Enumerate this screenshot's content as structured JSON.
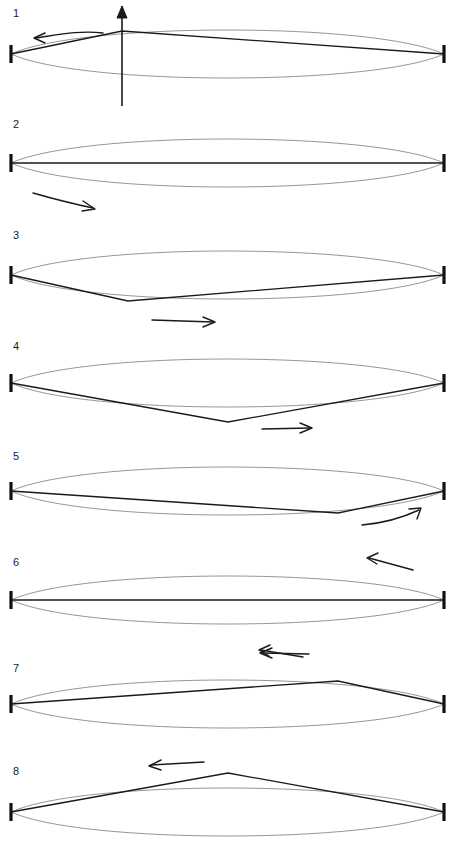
{
  "figure": {
    "width": 460,
    "height": 846,
    "background_color": "#ffffff",
    "string_color": "#1a1a1a",
    "envelope_color": "#8a8a8a",
    "support_color": "#111111"
  },
  "geometry": {
    "left_support_x": 11,
    "right_support_x": 444,
    "support_half_height": 9,
    "envelope_amplitude": 26
  },
  "chart_data": {
    "type": "line",
    "xlabel": "",
    "ylabel": "",
    "xlim": [
      11,
      444
    ],
    "grid": false,
    "legend": "none",
    "series": [
      {
        "name": "panel-1",
        "label": "1",
        "vertex_fraction": 0.256,
        "vertex_offset": -22,
        "shape": "peak",
        "x": [
          11,
          122,
          444
        ],
        "y": [
          0,
          -22,
          0
        ]
      },
      {
        "name": "panel-2",
        "label": "2",
        "vertex_fraction": 0.0,
        "vertex_offset": 0,
        "shape": "flat",
        "x": [
          11,
          444
        ],
        "y": [
          0,
          0
        ]
      },
      {
        "name": "panel-3",
        "label": "3",
        "vertex_fraction": 0.27,
        "vertex_offset": 22,
        "shape": "dip",
        "x": [
          11,
          128,
          444
        ],
        "y": [
          0,
          22,
          0
        ]
      },
      {
        "name": "panel-4",
        "label": "4",
        "vertex_fraction": 0.5,
        "vertex_offset": 26,
        "shape": "dip",
        "x": [
          11,
          228,
          444
        ],
        "y": [
          0,
          26,
          0
        ]
      },
      {
        "name": "panel-5",
        "label": "5",
        "vertex_fraction": 0.755,
        "vertex_offset": 22,
        "shape": "dip",
        "x": [
          11,
          338,
          444
        ],
        "y": [
          0,
          22,
          0
        ]
      },
      {
        "name": "panel-6",
        "label": "6",
        "vertex_fraction": 0.0,
        "vertex_offset": 0,
        "shape": "flat",
        "x": [
          11,
          444
        ],
        "y": [
          0,
          0
        ]
      },
      {
        "name": "panel-7",
        "label": "7",
        "vertex_fraction": 0.755,
        "vertex_offset": -22,
        "shape": "peak",
        "x": [
          11,
          338,
          444
        ],
        "y": [
          0,
          -22,
          0
        ]
      },
      {
        "name": "panel-8",
        "label": "8",
        "vertex_fraction": 0.5,
        "vertex_offset": -26,
        "shape": "peak",
        "x": [
          11,
          228,
          444
        ],
        "y": [
          0,
          -26,
          0
        ]
      }
    ]
  },
  "panels": [
    {
      "number": "1",
      "label_x": 13,
      "label_y": 17,
      "baseline_y": 54,
      "vertex_x": 122,
      "vertex_y": 31,
      "shape": "peak",
      "has_axis_arrow": true,
      "axis_arrow": {
        "x": 122,
        "y_bottom": 106,
        "y_top": 6
      },
      "motion_arrows": [
        {
          "name": "pulse-direction-arrow-left",
          "direction": "left",
          "path": "M 103,33 C 80,30 57,35 36,38",
          "head": "M 45,33 L 34,38 L 45,43"
        }
      ]
    },
    {
      "number": "2",
      "label_x": 13,
      "label_y": 128,
      "baseline_y": 163,
      "vertex_x": 0,
      "vertex_y": 163,
      "shape": "flat",
      "has_axis_arrow": false,
      "motion_arrows": [
        {
          "name": "pulse-direction-arrow-right",
          "direction": "right",
          "path": "M 33,193 C 54,199 74,204 93,208",
          "head": "M 83,201 L 95,209 L 82,211"
        }
      ]
    },
    {
      "number": "3",
      "label_x": 13,
      "label_y": 239,
      "baseline_y": 275,
      "vertex_x": 128,
      "vertex_y": 301,
      "shape": "dip",
      "has_axis_arrow": false,
      "motion_arrows": [
        {
          "name": "pulse-direction-arrow-right",
          "direction": "right",
          "path": "M 152,320 L 213,322",
          "head": "M 203,317 L 215,322 L 203,327"
        }
      ]
    },
    {
      "number": "4",
      "label_x": 13,
      "label_y": 350,
      "baseline_y": 383,
      "vertex_x": 228,
      "vertex_y": 422,
      "shape": "dip",
      "has_axis_arrow": false,
      "motion_arrows": [
        {
          "name": "pulse-direction-arrow-right",
          "direction": "right",
          "path": "M 262,429 L 310,428",
          "head": "M 300,423 L 312,428 L 300,433"
        }
      ]
    },
    {
      "number": "5",
      "label_x": 13,
      "label_y": 460,
      "baseline_y": 491,
      "vertex_x": 338,
      "vertex_y": 513,
      "shape": "dip",
      "has_axis_arrow": false,
      "motion_arrows": [
        {
          "name": "pulse-direction-arrow-right",
          "direction": "right",
          "path": "M 362,525 C 385,523 404,517 419,510",
          "head": "M 409,509 L 421,508 L 417,519"
        }
      ]
    },
    {
      "number": "6",
      "label_x": 13,
      "label_y": 566,
      "baseline_y": 600,
      "vertex_x": 0,
      "vertex_y": 600,
      "shape": "flat",
      "has_axis_arrow": false,
      "motion_arrows": [
        {
          "name": "pulse-direction-arrow-left-upper",
          "direction": "left",
          "path": "M 413,570 L 369,558",
          "head": "M 378,553 L 367,558 L 377,564"
        },
        {
          "name": "pulse-direction-arrow-left-lower",
          "direction": "left",
          "path": "M 303,657 L 261,650",
          "head": "M 270,645 L 259,650 L 269,656"
        }
      ]
    },
    {
      "number": "7",
      "label_x": 13,
      "label_y": 672,
      "baseline_y": 704,
      "vertex_x": 338,
      "vertex_y": 681,
      "shape": "peak",
      "has_axis_arrow": false,
      "motion_arrows": [
        {
          "name": "pulse-direction-arrow-left",
          "direction": "left",
          "path": "M 309,654 L 262,653",
          "head": "M 272,648 L 260,653 L 272,658"
        }
      ]
    },
    {
      "number": "8",
      "label_x": 13,
      "label_y": 775,
      "baseline_y": 812,
      "vertex_x": 228,
      "vertex_y": 773,
      "shape": "peak",
      "has_axis_arrow": false,
      "motion_arrows": [
        {
          "name": "pulse-direction-arrow-left",
          "direction": "left",
          "path": "M 204,762 L 151,765",
          "head": "M 161,760 L 149,766 L 161,770"
        }
      ]
    }
  ]
}
